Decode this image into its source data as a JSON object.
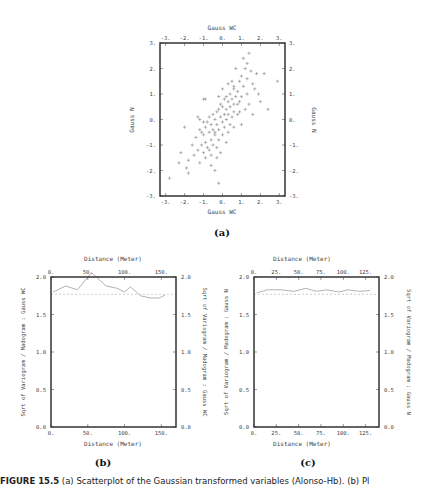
{
  "figure": {
    "caption_label_a": "(a)",
    "caption_label_b": "(b)",
    "caption_label_c": "(c)",
    "caption_prefix": "FIGURE 15.5",
    "caption_text": " (a) Scatterplot of the Gaussian transformed variables (Alonso-Hb). (b) Pl"
  },
  "chart_data": [
    {
      "id": "a",
      "type": "scatter",
      "title": "",
      "xlabel": "Gauss WC",
      "ylabel": "Gauss N",
      "x_top_label": "Gauss WC",
      "y_right_label": "Gauss N",
      "xlim": [
        -3.3,
        3.3
      ],
      "ylim": [
        -3,
        3
      ],
      "x_ticks": [
        "-3.",
        "-2.",
        "-1.",
        "0.",
        "1.",
        "2.",
        "3."
      ],
      "y_ticks": [
        "-3.",
        "-2.",
        "-1.",
        "0.",
        "1.",
        "2.",
        "3."
      ],
      "marker": "+",
      "grid": false,
      "points": [
        [
          1.4,
          2.6
        ],
        [
          1.1,
          2.4
        ],
        [
          1.3,
          2.2
        ],
        [
          0.7,
          2.0
        ],
        [
          1.2,
          2.0
        ],
        [
          1.8,
          1.8
        ],
        [
          2.2,
          1.8
        ],
        [
          1.5,
          1.9
        ],
        [
          1.0,
          1.7
        ],
        [
          1.3,
          1.6
        ],
        [
          0.5,
          1.5
        ],
        [
          0.9,
          1.5
        ],
        [
          1.6,
          1.4
        ],
        [
          2.9,
          1.5
        ],
        [
          0.3,
          1.4
        ],
        [
          1.1,
          1.3
        ],
        [
          1.7,
          1.2
        ],
        [
          0.6,
          1.2
        ],
        [
          0.0,
          1.2
        ],
        [
          0.8,
          1.1
        ],
        [
          1.3,
          1.0
        ],
        [
          0.4,
          1.0
        ],
        [
          1.9,
          1.0
        ],
        [
          0.2,
          0.9
        ],
        [
          0.7,
          0.9
        ],
        [
          1.0,
          0.9
        ],
        [
          -0.9,
          0.8
        ],
        [
          -1.0,
          0.8
        ],
        [
          0.5,
          0.8
        ],
        [
          0.1,
          0.8
        ],
        [
          0.9,
          0.7
        ],
        [
          2.0,
          0.7
        ],
        [
          0.3,
          0.7
        ],
        [
          0.6,
          0.6
        ],
        [
          -0.1,
          0.6
        ],
        [
          0.8,
          0.6
        ],
        [
          1.4,
          0.6
        ],
        [
          0.0,
          0.5
        ],
        [
          0.4,
          0.5
        ],
        [
          0.2,
          0.4
        ],
        [
          1.2,
          0.4
        ],
        [
          2.4,
          0.4
        ],
        [
          -0.2,
          0.4
        ],
        [
          0.6,
          0.3
        ],
        [
          0.9,
          0.3
        ],
        [
          -0.3,
          0.3
        ],
        [
          0.3,
          0.2
        ],
        [
          1.6,
          0.2
        ],
        [
          -0.5,
          0.2
        ],
        [
          0.1,
          0.2
        ],
        [
          -0.7,
          0.1
        ],
        [
          -1.3,
          0.1
        ],
        [
          -0.1,
          0.1
        ],
        [
          0.5,
          0.1
        ],
        [
          -1.2,
          0.0
        ],
        [
          -0.4,
          0.0
        ],
        [
          0.2,
          0.0
        ],
        [
          -0.8,
          -0.1
        ],
        [
          0.0,
          -0.1
        ],
        [
          -1.0,
          -0.1
        ],
        [
          -0.6,
          -0.2
        ],
        [
          0.4,
          -0.2
        ],
        [
          1.0,
          -0.2
        ],
        [
          -0.3,
          -0.2
        ],
        [
          -0.9,
          -0.3
        ],
        [
          -2.0,
          -0.3
        ],
        [
          0.1,
          -0.3
        ],
        [
          -0.5,
          -0.4
        ],
        [
          -1.2,
          -0.4
        ],
        [
          -0.2,
          -0.4
        ],
        [
          0.3,
          -0.5
        ],
        [
          -0.7,
          -0.5
        ],
        [
          -1.0,
          -0.6
        ],
        [
          -0.4,
          -0.6
        ],
        [
          0.0,
          -0.6
        ],
        [
          -1.4,
          -0.7
        ],
        [
          -0.6,
          -0.8
        ],
        [
          -0.2,
          -0.8
        ],
        [
          -0.9,
          -0.9
        ],
        [
          0.2,
          -0.9
        ],
        [
          -1.1,
          -1.0
        ],
        [
          -0.5,
          -1.0
        ],
        [
          -1.6,
          -1.0
        ],
        [
          -0.8,
          -1.1
        ],
        [
          -0.3,
          -1.1
        ],
        [
          -1.3,
          -1.2
        ],
        [
          -0.7,
          -1.2
        ],
        [
          -0.1,
          -1.3
        ],
        [
          -1.0,
          -1.3
        ],
        [
          -2.2,
          -1.3
        ],
        [
          -0.6,
          -1.4
        ],
        [
          -1.5,
          -1.4
        ],
        [
          -0.9,
          -1.5
        ],
        [
          -0.3,
          -1.5
        ],
        [
          -1.8,
          -1.6
        ],
        [
          -1.2,
          -1.7
        ],
        [
          -0.6,
          -1.8
        ],
        [
          -2.3,
          -1.7
        ],
        [
          -1.9,
          -1.9
        ],
        [
          -0.4,
          -2.0
        ],
        [
          -1.8,
          -2.1
        ],
        [
          -2.8,
          -2.3
        ],
        [
          -0.2,
          -2.5
        ],
        [
          0.6,
          1.3
        ],
        [
          -0.2,
          0.9
        ],
        [
          0.8,
          0.2
        ],
        [
          -0.4,
          -0.5
        ],
        [
          0.6,
          -0.3
        ],
        [
          -1.1,
          -0.5
        ]
      ]
    },
    {
      "id": "b",
      "type": "line",
      "title": "",
      "xlabel": "Distance (Meter)",
      "x_top_label": "Distance (Meter)",
      "ylabel": "Sqrt of Variogram / Madogram : Gauss WC",
      "y_right_label": "Sqrt of Variogram / Madogram : Gauss WC",
      "xlim": [
        0,
        170
      ],
      "ylim": [
        0.0,
        2.0
      ],
      "x_ticks": [
        "0.",
        "50.",
        "100.",
        "150."
      ],
      "y_ticks": [
        "0.0",
        "0.5",
        "1.0",
        "1.5",
        "2.0"
      ],
      "grid": false,
      "series": [
        {
          "name": "experimental",
          "style": "solid",
          "x": [
            3,
            20,
            36,
            55,
            75,
            90,
            100,
            108,
            122,
            135,
            147,
            155
          ],
          "values": [
            1.8,
            1.88,
            1.83,
            2.06,
            1.88,
            1.85,
            1.8,
            1.87,
            1.75,
            1.72,
            1.72,
            1.76
          ]
        },
        {
          "name": "sill",
          "style": "dashed",
          "x": [
            0,
            170
          ],
          "values": [
            1.77,
            1.77
          ]
        }
      ]
    },
    {
      "id": "c",
      "type": "line",
      "title": "",
      "xlabel": "Distance (Meter)",
      "x_top_label": "Distance (Meter)",
      "ylabel": "Sqrt of Variogram / Madogram : Gauss N",
      "y_right_label": "Sqrt of Variogram / Madogram : Gauss N",
      "xlim": [
        0,
        140
      ],
      "ylim": [
        0.0,
        2.0
      ],
      "x_ticks": [
        "0.",
        "25.",
        "50.",
        "75.",
        "100.",
        "125."
      ],
      "y_ticks": [
        "0.0",
        "0.5",
        "1.0",
        "1.5",
        "2.0"
      ],
      "grid": false,
      "series": [
        {
          "name": "experimental",
          "style": "solid",
          "x": [
            3,
            15,
            30,
            45,
            58,
            70,
            82,
            95,
            105,
            118,
            130
          ],
          "values": [
            1.79,
            1.83,
            1.83,
            1.81,
            1.85,
            1.81,
            1.83,
            1.8,
            1.83,
            1.81,
            1.82
          ]
        },
        {
          "name": "sill",
          "style": "dashed",
          "x": [
            0,
            140
          ],
          "values": [
            1.77,
            1.77
          ]
        }
      ]
    }
  ]
}
